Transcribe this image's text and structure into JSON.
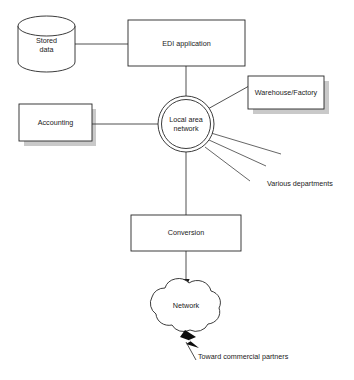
{
  "diagram": {
    "background_color": "#ffffff",
    "line_color": "#262626",
    "shadow_color": "#c9c9c9",
    "nodes": {
      "stored_data": {
        "label": "Stored\ndata",
        "shape": "cylinder"
      },
      "edi_application": {
        "label": "EDI application",
        "shape": "rectangle"
      },
      "warehouse_factory": {
        "label": "Warehouse/Factory",
        "shape": "rectangle-shadow"
      },
      "accounting": {
        "label": "Accounting",
        "shape": "rectangle-shadow"
      },
      "local_area_network": {
        "label": "Local area\nnetwork",
        "shape": "double-circle"
      },
      "conversion": {
        "label": "Conversion",
        "shape": "rectangle"
      },
      "network": {
        "label": "Network",
        "shape": "cloud"
      }
    },
    "annotations": {
      "various_departments": "Various departments",
      "toward_commercial_partners": "Toward commercial partners"
    }
  }
}
